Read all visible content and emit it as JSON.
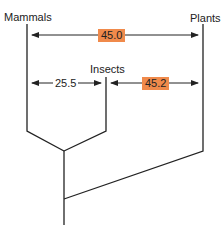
{
  "diagram": {
    "type": "phylogenetic-tree",
    "taxa": [
      {
        "name": "Mammals"
      },
      {
        "name": "Insects"
      },
      {
        "name": "Plants"
      }
    ],
    "distances": [
      {
        "from": "Mammals",
        "to": "Plants",
        "value": "45.0",
        "highlighted": true
      },
      {
        "from": "Mammals",
        "to": "Insects",
        "value": "25.5",
        "highlighted": false
      },
      {
        "from": "Insects",
        "to": "Plants",
        "value": "45.2",
        "highlighted": true
      }
    ],
    "colors": {
      "line": "#222222",
      "highlight": "#f08a4b"
    }
  }
}
